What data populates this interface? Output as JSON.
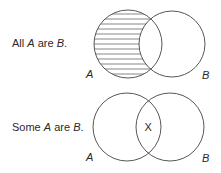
{
  "diagrams": [
    {
      "statement": {
        "pre": "All ",
        "a": "A",
        "mid": " are ",
        "b": "B",
        "post": "."
      },
      "labels": {
        "left": "A",
        "right": "B"
      },
      "shading": "A minus B (horizontal hatch)"
    },
    {
      "statement": {
        "pre": "Some ",
        "a": "A",
        "mid": " are ",
        "b": "B",
        "post": "."
      },
      "labels": {
        "left": "A",
        "right": "B"
      },
      "marker": "X"
    }
  ]
}
